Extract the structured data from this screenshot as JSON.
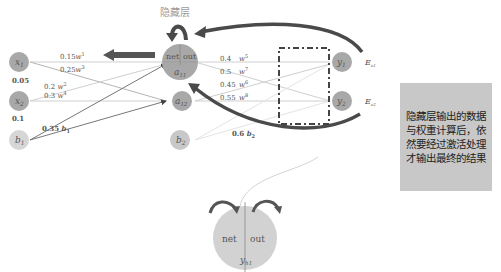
{
  "header": {
    "hidden_layer_label": "隐藏层"
  },
  "inputs": [
    {
      "name": "x1",
      "label": "x",
      "sub": "1",
      "value": "0.05"
    },
    {
      "name": "x2",
      "label": "x",
      "sub": "2",
      "value": "0.1"
    },
    {
      "name": "b1",
      "label": "b",
      "sub": "1"
    }
  ],
  "hidden": [
    {
      "name": "a11",
      "label": "a",
      "sub": "11",
      "net": "net",
      "out": "out"
    },
    {
      "name": "a12",
      "label": "a",
      "sub": "12"
    },
    {
      "name": "b2",
      "label": "b",
      "sub": "2"
    }
  ],
  "outputs": [
    {
      "name": "y1",
      "label": "y",
      "sub": "1",
      "error": "E",
      "error_sub": "o1"
    },
    {
      "name": "y2",
      "label": "y",
      "sub": "2",
      "error": "E",
      "error_sub": "o2"
    }
  ],
  "weights_input_hidden": [
    {
      "value": "0.15",
      "w": "w",
      "idx": "1"
    },
    {
      "value": "0.25",
      "w": "w",
      "idx": "3"
    },
    {
      "value": "0.2",
      "w": "w",
      "idx": "2"
    },
    {
      "value": "0.3",
      "w": "w",
      "idx": "4"
    },
    {
      "value": "0.35",
      "w": "b",
      "idx": "1"
    }
  ],
  "weights_hidden_output": [
    {
      "value": "0.4",
      "w": "w",
      "idx": "5"
    },
    {
      "value": "0.5",
      "w": "w",
      "idx": "7"
    },
    {
      "value": "0.45",
      "w": "w",
      "idx": "6"
    },
    {
      "value": "0.55",
      "w": "w",
      "idx": "8"
    }
  ],
  "bias2": {
    "value": "0.6",
    "label": "b",
    "sub": "2"
  },
  "detail_neuron": {
    "net": "net",
    "out": "out",
    "label": "y",
    "sub": "h1"
  },
  "note": {
    "text": "隐藏层输出的数据与权重计算后，依然要经过激活处理才输出最终的结果"
  },
  "colors": {
    "node": "#a8a8a8",
    "node_light": "#d6d6d6",
    "arrow_dark": "#4a4a4a",
    "edge": "#c8c8c8",
    "note_bg": "#c8c8c8"
  }
}
